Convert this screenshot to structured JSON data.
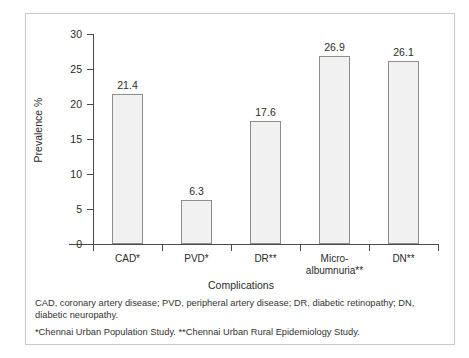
{
  "chart_data": {
    "type": "bar",
    "title": "",
    "xlabel": "Complications",
    "ylabel": "Prevalence %",
    "categories": [
      "CAD*",
      "PVD*",
      "DR**",
      "Micro-albumnuria**",
      "DN**"
    ],
    "category_lines": [
      [
        "CAD*"
      ],
      [
        "PVD*"
      ],
      [
        "DR**"
      ],
      [
        "Micro-",
        "albumnuria**"
      ],
      [
        "DN**"
      ]
    ],
    "values": [
      21.4,
      6.3,
      17.6,
      26.9,
      26.1
    ],
    "value_labels": [
      "21.4",
      "6.3",
      "17.6",
      "26.9",
      "26.1"
    ],
    "ylim": [
      0,
      30
    ],
    "yticks": [
      0,
      5,
      10,
      15,
      20,
      25,
      30
    ],
    "ytick_labels": [
      "0",
      "5",
      "10",
      "15",
      "20",
      "25",
      "30"
    ],
    "grid": false,
    "legend": false,
    "bar_fill": "#f1f1f1",
    "bar_border": "#8d8d8d",
    "axis_color": "#4a4a4a",
    "frame_color": "#c9c9c9"
  },
  "footnotes": {
    "line1": "CAD, coronary artery disease; PVD, peripheral artery disease; DR, diabetic retinopathy; DN, diabetic neuropathy.",
    "line2": "*Chennai Urban Population Study. **Chennai Urban Rural Epidemiology Study."
  }
}
